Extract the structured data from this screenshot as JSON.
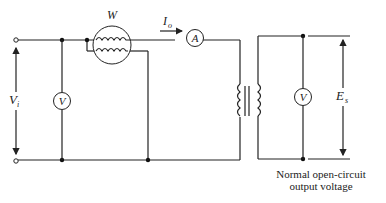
{
  "diagram": {
    "type": "circuit",
    "labels": {
      "wattmeter": "W",
      "current": "I",
      "current_sub": "o",
      "ammeter": "A",
      "input_voltmeter": "V",
      "output_voltmeter": "V",
      "input_voltage": "V",
      "input_voltage_sub": "i",
      "output_voltage": "E",
      "output_voltage_sub": "s"
    },
    "caption": {
      "line1": "Normal open-circuit",
      "line2": "output voltage"
    },
    "components": [
      {
        "id": "input-terminal-top",
        "kind": "terminal"
      },
      {
        "id": "input-terminal-bottom",
        "kind": "terminal"
      },
      {
        "id": "voltmeter-input",
        "kind": "voltmeter",
        "label": "V"
      },
      {
        "id": "wattmeter",
        "kind": "wattmeter",
        "label": "W"
      },
      {
        "id": "ammeter",
        "kind": "ammeter",
        "label": "A"
      },
      {
        "id": "transformer",
        "kind": "transformer"
      },
      {
        "id": "voltmeter-output",
        "kind": "voltmeter",
        "label": "V"
      }
    ],
    "colors": {
      "line": "#222222",
      "background": "#ffffff"
    }
  }
}
